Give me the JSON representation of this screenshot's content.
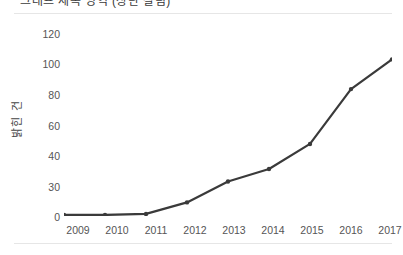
{
  "figure": {
    "title_clipped": "그래프 제목 영역 (상단 잘림)",
    "background_color": "#ffffff",
    "rule_color": "#e6e6e6"
  },
  "axis": {
    "y_title": "밝힌 건",
    "y_tick_labels": [
      "120",
      "100",
      "80",
      "60",
      "40",
      "30",
      "0"
    ],
    "x_tick_labels": [
      "2009",
      "2010",
      "2011",
      "2012",
      "2013",
      "2014",
      "2015",
      "2016",
      "2017"
    ]
  },
  "chart_data": {
    "type": "line",
    "title": "",
    "xlabel": "",
    "ylabel": "밝힌 건",
    "categories": [
      "2009",
      "2010",
      "2011",
      "2012",
      "2013",
      "2014",
      "2015",
      "2016",
      "2017"
    ],
    "x": [
      2009,
      2010,
      2011,
      2012,
      2013,
      2014,
      2015,
      2016,
      2017
    ],
    "values": [
      1,
      1,
      2,
      13,
      31,
      35,
      46,
      81,
      100
    ],
    "series": [
      {
        "name": "건수",
        "values": [
          1,
          1,
          2,
          13,
          31,
          35,
          46,
          81,
          100
        ]
      }
    ],
    "ytick_values": [
      120,
      100,
      80,
      60,
      40,
      30,
      0
    ],
    "ylim": [
      0,
      120
    ],
    "grid": false,
    "legend": "none",
    "line_color": "#3a3a3a",
    "marker_color": "#3a3a3a",
    "axis_color": "#9a9a9a",
    "note": "Y axis tick labels are drawn at equal pixel spacing even though the value gaps are unequal (30 appears between 0 and 40)."
  }
}
